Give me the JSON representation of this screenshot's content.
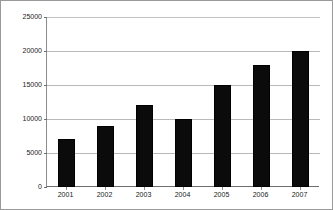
{
  "chart_data": {
    "type": "bar",
    "title": "",
    "xlabel": "",
    "ylabel": "",
    "categories": [
      "2001",
      "2002",
      "2003",
      "2004",
      "2005",
      "2006",
      "2007"
    ],
    "values": [
      7000,
      9000,
      12000,
      10000,
      15000,
      18000,
      20000
    ],
    "series": [
      {
        "name": "",
        "values": [
          7000,
          9000,
          12000,
          10000,
          15000,
          18000,
          20000
        ]
      }
    ],
    "ylim": [
      0,
      25000
    ],
    "yticks": [
      0,
      5000,
      10000,
      15000,
      20000,
      25000
    ],
    "ytick_labels": [
      "0",
      "5000",
      "10000",
      "15000",
      "20000",
      "25000"
    ],
    "xtick_labels": [
      "2001",
      "2002",
      "2003",
      "2004",
      "2005",
      "2006",
      "2007"
    ],
    "grid": "horizontal",
    "legend": "none",
    "bar_color": "#0b0b0b",
    "gridline_color": "#b9b9b9",
    "axis_color": "#6f6f6f",
    "background_color": "#ffffff",
    "border_color": "#9a9a9a"
  }
}
